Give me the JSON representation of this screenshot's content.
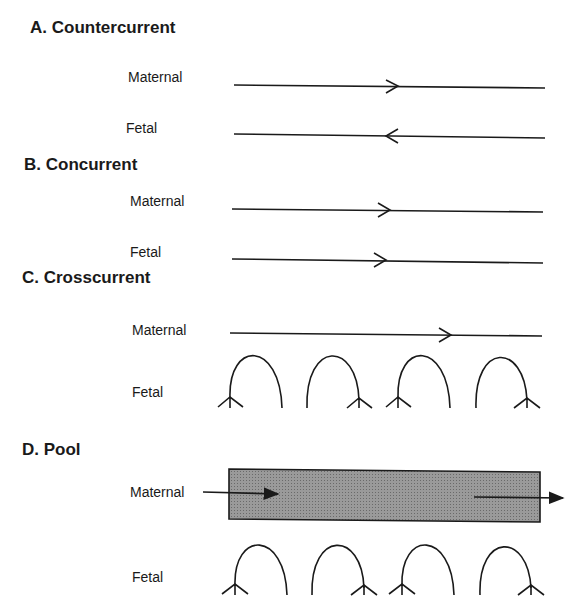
{
  "sections": {
    "a": {
      "title": "A. Countercurrent",
      "maternal": "Maternal",
      "fetal": "Fetal"
    },
    "b": {
      "title": "B.  Concurrent",
      "maternal": "Maternal",
      "fetal": "Fetal"
    },
    "c": {
      "title": "C.  Crosscurrent",
      "maternal": "Maternal",
      "fetal": "Fetal"
    },
    "d": {
      "title": "D.  Pool",
      "maternal": "Maternal",
      "fetal": "Fetal"
    }
  },
  "colors": {
    "ink": "#1a1a1a",
    "pool_fill": "#8a8a8a"
  }
}
